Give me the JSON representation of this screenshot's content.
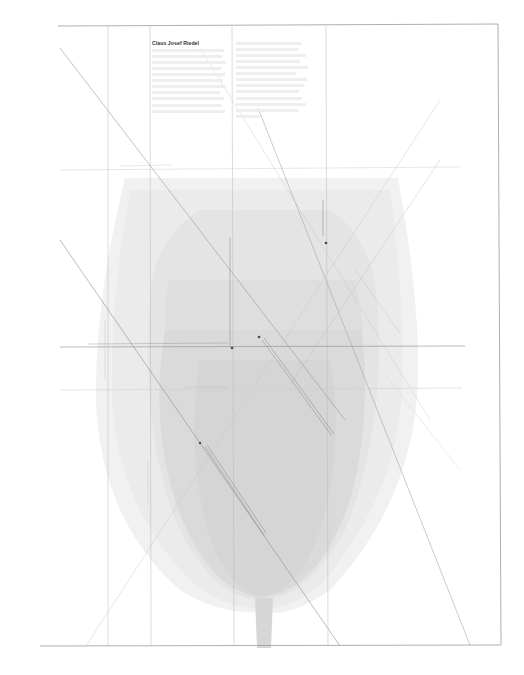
{
  "poster": {
    "title": "Claus Josef Riedel",
    "background": "#ffffff",
    "frame_color": "#9a9a9a",
    "grid_line_color": "#b4b4b4",
    "glass_fill_colors": [
      "#efefef",
      "#e6e6e6",
      "#dddddd",
      "#d5d5d5"
    ],
    "body_text_columns": [
      {
        "lines": 11,
        "legible": false
      },
      {
        "lines": 13,
        "legible": false
      }
    ],
    "annotations": [
      {
        "id": "horizontal-label-upper",
        "legible": false
      },
      {
        "id": "horizontal-label-center",
        "legible": false
      },
      {
        "id": "horizontal-label-lower",
        "legible": false
      },
      {
        "id": "vertical-label-center",
        "legible": false
      },
      {
        "id": "vertical-label-right",
        "legible": false
      },
      {
        "id": "diagonal-label-center",
        "legible": false
      },
      {
        "id": "diagonal-label-lower",
        "legible": false
      },
      {
        "id": "diagonal-label-right",
        "legible": false
      },
      {
        "id": "vertical-label-left-margin",
        "legible": false
      },
      {
        "id": "vertical-label-left-lower",
        "legible": false
      }
    ],
    "markers": [
      {
        "x": 232,
        "y": 348
      },
      {
        "x": 259,
        "y": 337
      },
      {
        "x": 326,
        "y": 243
      },
      {
        "x": 200,
        "y": 443
      }
    ]
  }
}
